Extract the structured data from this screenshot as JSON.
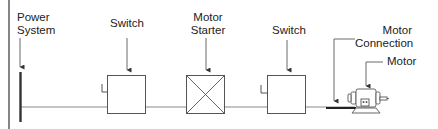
{
  "diagram": {
    "type": "one-line electrical diagram",
    "colors": {
      "line": "#6a6a6a",
      "bus": "#333333",
      "text": "#222222",
      "background": "#ffffff"
    },
    "labels": {
      "power_system_line1": "Power",
      "power_system_line2": "System",
      "switch1": "Switch",
      "motor_starter_line1": "Motor",
      "motor_starter_line2": "Starter",
      "switch2": "Switch",
      "motor_connection_line1": "Motor",
      "motor_connection_line2": "Connection",
      "motor": "Motor"
    },
    "components": [
      {
        "id": "power-system",
        "name": "Power System",
        "symbol": "bus-bar"
      },
      {
        "id": "switch-1",
        "name": "Switch",
        "symbol": "box-with-handle"
      },
      {
        "id": "motor-starter",
        "name": "Motor Starter",
        "symbol": "box-with-x"
      },
      {
        "id": "switch-2",
        "name": "Switch",
        "symbol": "box-with-handle"
      },
      {
        "id": "motor-connection",
        "name": "Motor Connection",
        "symbol": "thick-lead"
      },
      {
        "id": "motor",
        "name": "Motor",
        "symbol": "motor-pictogram"
      }
    ]
  }
}
